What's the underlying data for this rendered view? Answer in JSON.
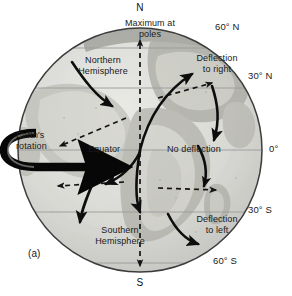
{
  "figure": {
    "panel_label": "(a)",
    "caption_topic": "Coriolis effect deflection on a rotating Earth"
  },
  "poles": {
    "north": "N",
    "south": "S"
  },
  "latitudes": [
    {
      "id": "lat-60n",
      "label": "60° N",
      "y": 48
    },
    {
      "id": "lat-30n",
      "label": "30° N",
      "y": 88
    },
    {
      "id": "lat-0",
      "label": "0°",
      "y": 150
    },
    {
      "id": "lat-30s",
      "label": "30° S",
      "y": 212
    },
    {
      "id": "lat-60s",
      "label": "60° S",
      "y": 263
    }
  ],
  "annotations": {
    "maximum_at_poles": "Maximum at\npoles",
    "northern_hemisphere": "Northern\nHemisphere",
    "southern_hemisphere": "Southern\nHemisphere",
    "deflection_to_right": "Deflection\nto right",
    "deflection_to_left": "Deflection\nto left",
    "no_deflection": "No deflection",
    "equator": "Equator",
    "earths_rotation": "Earth's\nrotation"
  },
  "colors": {
    "globe_fill": "#d8d8d4",
    "globe_outline": "#3c3c3c",
    "latitude_line": "#9a9a9a",
    "arrow_solid": "#0d0d0d",
    "arrow_dashed": "#111111",
    "text": "#1a1a1a",
    "background": "#ffffff"
  },
  "geometry": {
    "globe_center_x": 140,
    "globe_center_y": 150,
    "globe_radius": 122
  }
}
